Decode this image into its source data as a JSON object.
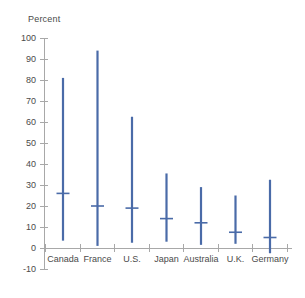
{
  "chart_data": {
    "type": "bar",
    "title": "",
    "subtitle": "",
    "xlabel": "",
    "ylabel": "Percent",
    "ylim": [
      -10,
      100
    ],
    "ytick_step": 10,
    "yticks": [
      100,
      90,
      80,
      70,
      60,
      50,
      40,
      30,
      20,
      10,
      0,
      -10
    ],
    "ytick_labels": [
      "100",
      "90",
      "80",
      "70",
      "60",
      "50",
      "40",
      "30",
      "20",
      "10",
      "0",
      "-10"
    ],
    "grid": false,
    "legend": "none",
    "orientation": "vertical",
    "marker_style": "range-with-median-tick",
    "categories": [
      "Canada",
      "France",
      "U.S.",
      "Japan",
      "Australia",
      "U.K.",
      "Germany"
    ],
    "series": [
      {
        "name": "High",
        "values": [
          81,
          94,
          62.5,
          35.5,
          29,
          25,
          32.5
        ]
      },
      {
        "name": "Low",
        "values": [
          3.5,
          1,
          2.5,
          3,
          1.5,
          2,
          -2.5
        ]
      },
      {
        "name": "Median",
        "values": [
          26,
          20,
          19,
          14,
          12,
          7.5,
          5
        ]
      }
    ],
    "points": [
      {
        "category": "Canada",
        "high": 81,
        "low": 3.5,
        "median": 26
      },
      {
        "category": "France",
        "high": 94,
        "low": 1,
        "median": 20
      },
      {
        "category": "U.S.",
        "high": 62.5,
        "low": 2.5,
        "median": 19
      },
      {
        "category": "Japan",
        "high": 35.5,
        "low": 3,
        "median": 14
      },
      {
        "category": "Australia",
        "high": 29,
        "low": 1.5,
        "median": 12
      },
      {
        "category": "U.K.",
        "high": 25,
        "low": 2,
        "median": 7.5
      },
      {
        "category": "Germany",
        "high": 32.5,
        "low": -2.5,
        "median": 5
      }
    ],
    "colors": {
      "bar": "#4A6BA8",
      "median": "#4A6BA8",
      "axis": "#a8a8a8",
      "text": "#4a4a4a",
      "background": "#ffffff"
    }
  }
}
